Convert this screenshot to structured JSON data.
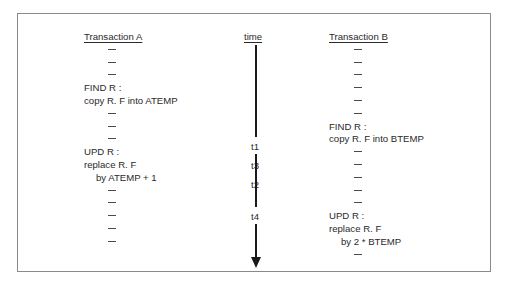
{
  "diagram": {
    "time_header": "time",
    "time_points": [
      "t1",
      "t2",
      "t3",
      "t4"
    ],
    "transaction_a": {
      "header": "Transaction A",
      "lines": [
        {
          "type": "dash",
          "text": "–"
        },
        {
          "type": "dash",
          "text": "–"
        },
        {
          "type": "dash",
          "text": "–"
        },
        {
          "type": "text",
          "text": "FIND R :",
          "indent": 0
        },
        {
          "type": "text",
          "text": "copy R. F into ATEMP",
          "indent": 0
        },
        {
          "type": "dash",
          "text": "–"
        },
        {
          "type": "dash",
          "text": "–"
        },
        {
          "type": "dash",
          "text": "–"
        },
        {
          "type": "text",
          "text": "UPD R :",
          "indent": 0
        },
        {
          "type": "text",
          "text": "replace R. F",
          "indent": 0
        },
        {
          "type": "text",
          "text": "by ATEMP + 1",
          "indent": 1
        },
        {
          "type": "dash",
          "text": "–"
        },
        {
          "type": "dash",
          "text": "–"
        },
        {
          "type": "dash",
          "text": "–"
        },
        {
          "type": "dash",
          "text": "–"
        },
        {
          "type": "dash",
          "text": "–"
        }
      ]
    },
    "transaction_b": {
      "header": "Transaction B",
      "lines": [
        {
          "type": "dash",
          "text": "–"
        },
        {
          "type": "dash",
          "text": "–"
        },
        {
          "type": "dash",
          "text": "–"
        },
        {
          "type": "dash",
          "text": "–"
        },
        {
          "type": "dash",
          "text": "–"
        },
        {
          "type": "dash",
          "text": "–"
        },
        {
          "type": "text",
          "text": "FIND R :",
          "indent": 0
        },
        {
          "type": "text",
          "text": "copy R. F into BTEMP",
          "indent": 0
        },
        {
          "type": "dash",
          "text": "–"
        },
        {
          "type": "dash",
          "text": "–"
        },
        {
          "type": "dash",
          "text": "–"
        },
        {
          "type": "dash",
          "text": "–"
        },
        {
          "type": "dash",
          "text": "–"
        },
        {
          "type": "text",
          "text": "UPD R :",
          "indent": 0
        },
        {
          "type": "text",
          "text": "replace R. F",
          "indent": 0
        },
        {
          "type": "text",
          "text": "by 2 * BTEMP",
          "indent": 1
        },
        {
          "type": "dash",
          "text": "–"
        }
      ]
    }
  }
}
